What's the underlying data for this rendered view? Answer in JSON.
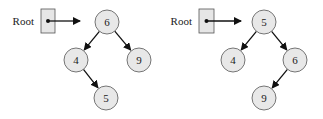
{
  "colors": {
    "node_fill": "#e8e8e8",
    "node_stroke": "#555555",
    "box_fill": "#e6e6e6",
    "edge": "#111111",
    "text": "#222222"
  },
  "trees": [
    {
      "root_label": "Root",
      "nodes": [
        {
          "id": "a",
          "value": "6",
          "cx": 107,
          "cy": 22
        },
        {
          "id": "b",
          "value": "4",
          "cx": 76,
          "cy": 60
        },
        {
          "id": "c",
          "value": "9",
          "cx": 139,
          "cy": 60
        },
        {
          "id": "d",
          "value": "5",
          "cx": 106,
          "cy": 98
        }
      ],
      "edges": [
        [
          "a",
          "b"
        ],
        [
          "a",
          "c"
        ],
        [
          "b",
          "d"
        ]
      ],
      "box": {
        "x": 41,
        "y": 9,
        "w": 14,
        "h": 24
      },
      "label_x": 34,
      "label_y": 25,
      "pointer_to_x": 80,
      "pointer_y": 21
    },
    {
      "root_label": "Root",
      "nodes": [
        {
          "id": "a",
          "value": "5",
          "cx": 264,
          "cy": 22
        },
        {
          "id": "b",
          "value": "4",
          "cx": 233,
          "cy": 60
        },
        {
          "id": "c",
          "value": "6",
          "cx": 295,
          "cy": 60
        },
        {
          "id": "d",
          "value": "9",
          "cx": 264,
          "cy": 98
        }
      ],
      "edges": [
        [
          "a",
          "b"
        ],
        [
          "a",
          "c"
        ],
        [
          "c",
          "d"
        ]
      ],
      "box": {
        "x": 199,
        "y": 9,
        "w": 15,
        "h": 24
      },
      "label_x": 192,
      "label_y": 25,
      "pointer_to_x": 241,
      "pointer_y": 21
    }
  ]
}
